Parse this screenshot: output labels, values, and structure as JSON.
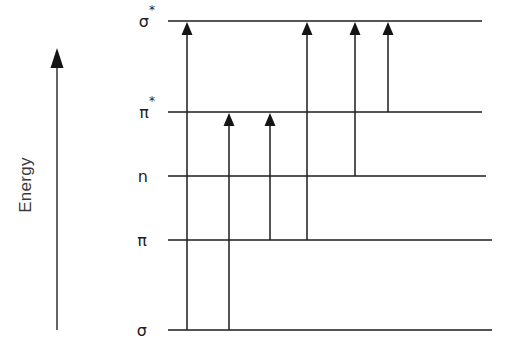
{
  "figure": {
    "name": "molecular-orbital-energy-level-diagram",
    "background_color": "#ffffff",
    "line_color": "#1d1d1f",
    "axis_color": "#4a4a4a"
  },
  "axis": {
    "label": "Energy",
    "orientation": "vertical-upward",
    "arrow_x": 57,
    "arrow_top_y": 55,
    "arrow_bottom_y": 330,
    "label_x": 27,
    "label_y": 185
  },
  "levels": [
    {
      "id": "sigma-star",
      "base": "σ",
      "star": "*",
      "label": "σ*",
      "y": 21,
      "x_start": 168,
      "x_end": 482,
      "label_x": 155
    },
    {
      "id": "pi-star",
      "base": "π",
      "star": "*",
      "label": "π*",
      "y": 112,
      "x_start": 168,
      "x_end": 482,
      "label_x": 155
    },
    {
      "id": "n",
      "base": "n",
      "star": "",
      "label": "n",
      "y": 176,
      "x_start": 168,
      "x_end": 486,
      "label_x": 148
    },
    {
      "id": "pi",
      "base": "π",
      "star": "",
      "label": "π",
      "y": 240,
      "x_start": 168,
      "x_end": 492,
      "label_x": 147
    },
    {
      "id": "sigma",
      "base": "σ",
      "star": "",
      "label": "σ",
      "y": 330,
      "x_start": 168,
      "x_end": 492,
      "label_x": 147
    }
  ],
  "transitions": [
    {
      "id": "sigma-to-sigma-star",
      "label": "σ → σ*",
      "from": "sigma",
      "to": "sigma-star",
      "x": 187,
      "y_from": 330,
      "y_to": 21
    },
    {
      "id": "sigma-to-pi-star",
      "label": "σ → π*",
      "from": "sigma",
      "to": "pi-star",
      "x": 229,
      "y_from": 330,
      "y_to": 112
    },
    {
      "id": "pi-to-pi-star",
      "label": "π → π*",
      "from": "pi",
      "to": "pi-star",
      "x": 270,
      "y_from": 240,
      "y_to": 112
    },
    {
      "id": "pi-to-sigma-star",
      "label": "π → σ*",
      "from": "pi",
      "to": "sigma-star",
      "x": 307,
      "y_from": 240,
      "y_to": 21
    },
    {
      "id": "n-to-sigma-star",
      "label": "n → σ*",
      "from": "n",
      "to": "sigma-star",
      "x": 355,
      "y_from": 176,
      "y_to": 21
    },
    {
      "id": "pi-star-to-sigma-star",
      "label": "π* → σ*",
      "from": "pi-star",
      "to": "sigma-star",
      "x": 388,
      "y_from": 112,
      "y_to": 21
    }
  ],
  "chart_data": {
    "type": "diagram",
    "title": "",
    "xlabel": "",
    "ylabel": "Energy",
    "categories": [
      "σ*",
      "π*",
      "n",
      "π",
      "σ"
    ],
    "values": [
      330,
      239,
      175,
      111,
      21
    ],
    "series": [
      {
        "name": "energy levels (relative, higher = greater energy)",
        "values": [
          330,
          239,
          175,
          111,
          21
        ]
      }
    ],
    "annotations": [
      "σ → σ*",
      "σ → π*",
      "π → π*",
      "π → σ*",
      "n → σ*",
      "π* → σ*"
    ],
    "grid": false,
    "legend": "none"
  }
}
